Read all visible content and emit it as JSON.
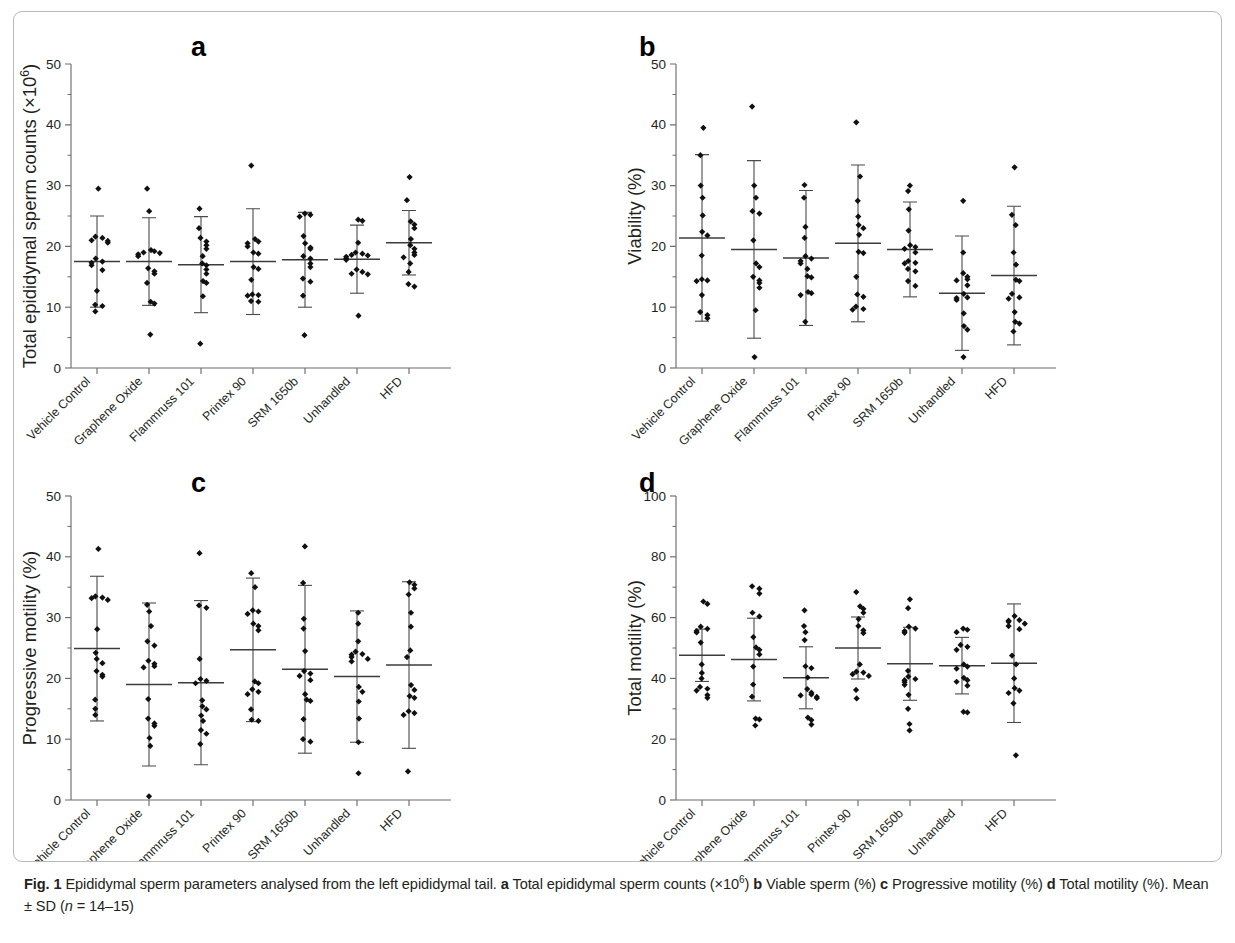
{
  "figure": {
    "caption_label": "Fig. 1",
    "caption_part1": " Epididymal sperm parameters analysed from the left epididymal tail. ",
    "caption_a_letter": "a",
    "caption_a_text": " Total epididymal sperm counts (×10",
    "caption_a_sup": "6",
    "caption_a_close": ") ",
    "caption_b_letter": "b",
    "caption_b_text": " Viable sperm (%) ",
    "caption_c_letter": "c",
    "caption_c_text": " Progressive motility (%) ",
    "caption_d_letter": "d",
    "caption_d_text": " Total motility (%). Mean ± SD (",
    "caption_n_italic": "n",
    "caption_n_rest": " = 14–15)"
  },
  "panels": {
    "a": {
      "letter": "a"
    },
    "b": {
      "letter": "b"
    },
    "c": {
      "letter": "c"
    },
    "d": {
      "letter": "d"
    }
  },
  "chart_data": [
    {
      "id": "a",
      "type": "scatter",
      "title": "",
      "panel_letter": "a",
      "xlabel": "",
      "ylabel": "Total epididymal sperm counts (×10⁶)",
      "ylabel_main": "Total epididymal sperm counts (×10",
      "ylabel_sup": "6",
      "ylabel_end": ")",
      "ylim": [
        0,
        50
      ],
      "yticks": [
        0,
        10,
        20,
        30,
        40,
        50
      ],
      "ytick_labels": [
        "0",
        "10",
        "20",
        "30",
        "40",
        "50"
      ],
      "yminor_step": 5,
      "grid": false,
      "legend": "none",
      "categories": [
        "Vehicle Control",
        "Graphene Oxide",
        "Flammruss 101",
        "Printex 90",
        "SRM 1650b",
        "Unhandled",
        "HFD"
      ],
      "groups": [
        {
          "name": "Vehicle Control",
          "mean": 17.5,
          "sd": 7.5,
          "values": [
            29.5,
            21.6,
            21.4,
            21.0,
            20.9,
            20.6,
            18.0,
            17.5,
            17.3,
            16.9,
            16.1,
            12.7,
            10.4,
            10.2,
            9.3
          ]
        },
        {
          "name": "Graphene Oxide",
          "mean": 17.5,
          "sd": 7.2,
          "values": [
            29.5,
            25.8,
            19.4,
            19.2,
            19.0,
            18.9,
            18.7,
            18.4,
            16.4,
            15.9,
            15.5,
            14.0,
            10.9,
            10.6,
            5.5
          ]
        },
        {
          "name": "Flammruss 101",
          "mean": 17.0,
          "sd": 7.9,
          "values": [
            26.2,
            23.0,
            21.4,
            20.8,
            20.2,
            19.6,
            18.4,
            17.2,
            16.9,
            16.2,
            15.5,
            14.3,
            14.0,
            11.8,
            4.0
          ]
        },
        {
          "name": "Printex 90",
          "mean": 17.5,
          "sd": 8.7,
          "values": [
            33.3,
            21.2,
            20.8,
            20.5,
            20.0,
            19.0,
            18.8,
            16.6,
            16.3,
            14.5,
            12.1,
            12.0,
            11.9,
            11.0,
            10.9
          ]
        },
        {
          "name": "SRM 1650b",
          "mean": 17.8,
          "sd": 7.8,
          "values": [
            25.4,
            25.2,
            24.9,
            21.7,
            20.5,
            19.8,
            19.6,
            18.4,
            18.0,
            17.2,
            16.6,
            14.7,
            14.2,
            11.9,
            5.4
          ]
        },
        {
          "name": "Unhandled",
          "mean": 17.9,
          "sd": 5.6,
          "values": [
            24.4,
            24.2,
            20.6,
            19.0,
            18.8,
            18.6,
            18.5,
            18.3,
            18.0,
            17.8,
            16.2,
            15.8,
            15.5,
            15.4,
            8.6
          ]
        },
        {
          "name": "HFD",
          "mean": 20.6,
          "sd": 5.3,
          "values": [
            31.4,
            27.6,
            24.1,
            23.6,
            23.0,
            21.2,
            20.2,
            19.6,
            19.0,
            18.6,
            18.2,
            17.2,
            15.8,
            13.8,
            13.4
          ]
        }
      ]
    },
    {
      "id": "b",
      "type": "scatter",
      "panel_letter": "b",
      "xlabel": "",
      "ylabel": "Viability (%)",
      "ylim": [
        0,
        50
      ],
      "yticks": [
        0,
        10,
        20,
        30,
        40,
        50
      ],
      "ytick_labels": [
        "0",
        "10",
        "20",
        "30",
        "40",
        "50"
      ],
      "yminor_step": 5,
      "grid": false,
      "legend": "none",
      "categories": [
        "Vehicle Control",
        "Graphene Oxide",
        "Flammruss 101",
        "Printex 90",
        "SRM 1650b",
        "Unhandled",
        "HFD"
      ],
      "groups": [
        {
          "name": "Vehicle Control",
          "mean": 21.4,
          "sd": 13.7,
          "values": [
            39.5,
            35.0,
            30.0,
            28.0,
            25.1,
            22.4,
            21.8,
            18.5,
            14.6,
            14.4,
            14.3,
            12.0,
            9.2,
            8.7,
            8.2
          ]
        },
        {
          "name": "Graphene Oxide",
          "mean": 19.5,
          "sd": 14.6,
          "values": [
            43.0,
            30.0,
            28.0,
            25.8,
            25.4,
            21.0,
            17.2,
            16.6,
            15.0,
            14.4,
            14.0,
            13.2,
            9.5,
            1.8
          ]
        },
        {
          "name": "Flammruss 101",
          "mean": 18.1,
          "sd": 11.1,
          "values": [
            30.1,
            28.0,
            23.2,
            21.4,
            18.4,
            18.0,
            17.6,
            17.2,
            16.3,
            15.1,
            14.9,
            12.5,
            12.3,
            12.0,
            7.6
          ]
        },
        {
          "name": "Printex 90",
          "mean": 20.5,
          "sd": 12.9,
          "values": [
            40.4,
            31.5,
            27.5,
            24.9,
            23.5,
            23.0,
            21.9,
            19.1,
            18.9,
            15.0,
            12.1,
            11.7,
            10.1,
            9.7,
            9.6
          ]
        },
        {
          "name": "SRM 1650b",
          "mean": 19.5,
          "sd": 7.8,
          "values": [
            30.0,
            29.1,
            26.1,
            22.6,
            20.2,
            19.9,
            19.6,
            19.0,
            17.6,
            17.3,
            17.2,
            16.3,
            15.9,
            14.3,
            13.5
          ]
        },
        {
          "name": "Unhandled",
          "mean": 12.3,
          "sd": 9.4,
          "values": [
            27.5,
            19.0,
            15.6,
            15.0,
            14.6,
            14.4,
            13.6,
            12.2,
            11.6,
            11.5,
            11.2,
            9.0,
            6.9,
            6.3,
            1.8
          ]
        },
        {
          "name": "HFD",
          "mean": 15.2,
          "sd": 11.4,
          "values": [
            33.0,
            25.2,
            23.5,
            19.0,
            17.0,
            14.5,
            14.3,
            12.2,
            11.6,
            11.4,
            9.2,
            7.6,
            7.3,
            6.0
          ]
        }
      ]
    },
    {
      "id": "c",
      "type": "scatter",
      "panel_letter": "c",
      "xlabel": "",
      "ylabel": "Progressive motility (%)",
      "ylim": [
        0,
        50
      ],
      "yticks": [
        0,
        10,
        20,
        30,
        40,
        50
      ],
      "ytick_labels": [
        "0",
        "10",
        "20",
        "30",
        "40",
        "50"
      ],
      "yminor_step": 5,
      "grid": false,
      "legend": "none",
      "categories": [
        "Vehicle Control",
        "Graphene Oxide",
        "Flammruss 101",
        "Printex 90",
        "SRM 1650b",
        "Unhandled",
        "HFD"
      ],
      "groups": [
        {
          "name": "Vehicle Control",
          "mean": 24.9,
          "sd": 11.9,
          "values": [
            41.3,
            33.5,
            33.3,
            33.2,
            32.9,
            28.1,
            24.2,
            23.2,
            22.5,
            21.2,
            20.6,
            20.3,
            16.5,
            15.0,
            14.0
          ]
        },
        {
          "name": "Graphene Oxide",
          "mean": 19.0,
          "sd": 13.4,
          "values": [
            32.1,
            31.0,
            28.6,
            26.1,
            25.4,
            22.9,
            22.4,
            22.0,
            21.8,
            16.6,
            13.4,
            12.6,
            12.2,
            10.2,
            8.9,
            0.6
          ]
        },
        {
          "name": "Flammruss 101",
          "mean": 19.3,
          "sd": 13.5,
          "values": [
            40.6,
            32.0,
            31.6,
            23.2,
            19.9,
            19.6,
            19.2,
            16.4,
            15.4,
            14.9,
            13.9,
            13.0,
            11.5,
            10.9,
            9.2
          ]
        },
        {
          "name": "Printex 90",
          "mean": 24.7,
          "sd": 11.8,
          "values": [
            37.3,
            35.0,
            31.2,
            31.0,
            30.6,
            29.0,
            28.6,
            27.9,
            19.5,
            19.2,
            18.2,
            17.8,
            17.4,
            14.9,
            13.2,
            13.0
          ]
        },
        {
          "name": "SRM 1650b",
          "mean": 21.5,
          "sd": 13.8,
          "values": [
            41.7,
            35.7,
            29.8,
            28.2,
            24.5,
            21.2,
            20.8,
            20.4,
            19.7,
            17.4,
            16.5,
            16.3,
            13.3,
            10.0,
            9.6
          ]
        },
        {
          "name": "Unhandled",
          "mean": 20.3,
          "sd": 10.8,
          "values": [
            30.8,
            29.0,
            26.1,
            24.4,
            24.0,
            23.9,
            23.5,
            23.2,
            22.8,
            18.6,
            17.8,
            16.2,
            13.4,
            9.5,
            4.4
          ]
        },
        {
          "name": "HFD",
          "mean": 22.2,
          "sd": 13.7,
          "values": [
            35.8,
            35.4,
            34.8,
            33.8,
            30.8,
            28.5,
            24.6,
            23.5,
            18.9,
            18.1,
            17.1,
            16.8,
            14.6,
            14.3,
            14.0,
            4.7
          ]
        }
      ]
    },
    {
      "id": "d",
      "type": "scatter",
      "panel_letter": "d",
      "xlabel": "",
      "ylabel": "Total motility (%)",
      "ylim": [
        0,
        100
      ],
      "yticks": [
        0,
        20,
        40,
        60,
        80,
        100
      ],
      "ytick_labels": [
        "0",
        "20",
        "40",
        "60",
        "80",
        "100"
      ],
      "yminor_step": 10,
      "grid": false,
      "legend": "none",
      "categories": [
        "Vehicle Control",
        "Graphene Oxide",
        "Flammruss 101",
        "Printex 90",
        "SRM 1650b",
        "Unhandled",
        "HFD"
      ],
      "groups": [
        {
          "name": "Vehicle Control",
          "mean": 47.6,
          "sd": 8.6,
          "values": [
            65.3,
            64.5,
            57.0,
            56.3,
            55.6,
            55.1,
            51.8,
            44.6,
            41.8,
            40.0,
            37.2,
            36.6,
            36.0,
            34.5,
            33.6
          ]
        },
        {
          "name": "Graphene Oxide",
          "mean": 46.2,
          "sd": 13.6,
          "values": [
            70.3,
            69.5,
            67.9,
            61.6,
            60.4,
            53.6,
            50.2,
            49.4,
            47.9,
            43.9,
            38.0,
            34.0,
            26.8,
            26.5,
            24.5
          ]
        },
        {
          "name": "Flammruss 101",
          "mean": 40.2,
          "sd": 10.2,
          "values": [
            62.4,
            57.2,
            55.2,
            52.6,
            44.0,
            43.4,
            40.3,
            36.5,
            35.3,
            34.7,
            34.4,
            33.9,
            33.5,
            27.1,
            26.3,
            24.8
          ]
        },
        {
          "name": "Printex 90",
          "mean": 50.0,
          "sd": 10.2,
          "values": [
            68.4,
            63.7,
            62.9,
            61.6,
            59.5,
            57.2,
            55.8,
            54.9,
            44.6,
            42.2,
            41.9,
            41.4,
            40.8,
            36.2,
            33.4
          ]
        },
        {
          "name": "SRM 1650b",
          "mean": 44.8,
          "sd": 12.0,
          "values": [
            66.0,
            63.1,
            57.0,
            56.4,
            55.6,
            55.0,
            42.5,
            40.6,
            39.8,
            39.4,
            38.8,
            37.9,
            34.6,
            30.0,
            25.0,
            22.9
          ]
        },
        {
          "name": "Unhandled",
          "mean": 44.2,
          "sd": 9.3,
          "values": [
            56.4,
            56.0,
            55.2,
            51.0,
            50.4,
            49.4,
            44.6,
            43.9,
            43.2,
            40.2,
            39.4,
            38.9,
            37.6,
            29.0,
            28.8
          ]
        },
        {
          "name": "HFD",
          "mean": 45.0,
          "sd": 19.5,
          "values": [
            60.5,
            59.2,
            59.0,
            58.6,
            58.0,
            57.2,
            56.2,
            47.5,
            44.6,
            40.0,
            36.8,
            36.0,
            35.2,
            31.8,
            14.7
          ]
        }
      ]
    }
  ]
}
